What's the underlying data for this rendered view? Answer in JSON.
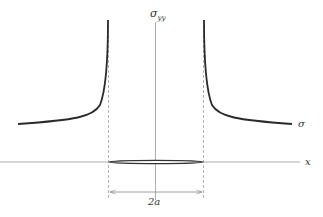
{
  "diagram": {
    "labels": {
      "sigma_yy": "σ",
      "sigma_yy_sub": "yy",
      "sigma": "σ",
      "x_axis": "x",
      "crack_length": "2a"
    },
    "colors": {
      "curve": "#2a2a2a",
      "axis": "#9a9a9a",
      "dashed": "#a0a0a0",
      "crack": "#333333",
      "text": "#333333"
    }
  }
}
